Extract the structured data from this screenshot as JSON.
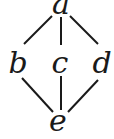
{
  "diagram": {
    "type": "hasse-diagram",
    "nodes": [
      {
        "id": "a",
        "label": "a",
        "x": 61,
        "y": 14
      },
      {
        "id": "b",
        "label": "b",
        "x": 18,
        "y": 73
      },
      {
        "id": "c",
        "label": "c",
        "x": 60,
        "y": 73
      },
      {
        "id": "d",
        "label": "d",
        "x": 102,
        "y": 73
      },
      {
        "id": "e",
        "label": "e",
        "x": 58,
        "y": 131
      }
    ],
    "edges": [
      {
        "from": "a",
        "to": "b",
        "x1": 52,
        "y1": 16,
        "x2": 24,
        "y2": 44
      },
      {
        "from": "a",
        "to": "c",
        "x1": 61,
        "y1": 17,
        "x2": 61,
        "y2": 45
      },
      {
        "from": "a",
        "to": "d",
        "x1": 70,
        "y1": 16,
        "x2": 98,
        "y2": 44
      },
      {
        "from": "b",
        "to": "e",
        "x1": 22,
        "y1": 78,
        "x2": 53,
        "y2": 112
      },
      {
        "from": "c",
        "to": "e",
        "x1": 61,
        "y1": 76,
        "x2": 61,
        "y2": 110
      },
      {
        "from": "d",
        "to": "e",
        "x1": 98,
        "y1": 80,
        "x2": 68,
        "y2": 112
      }
    ]
  }
}
